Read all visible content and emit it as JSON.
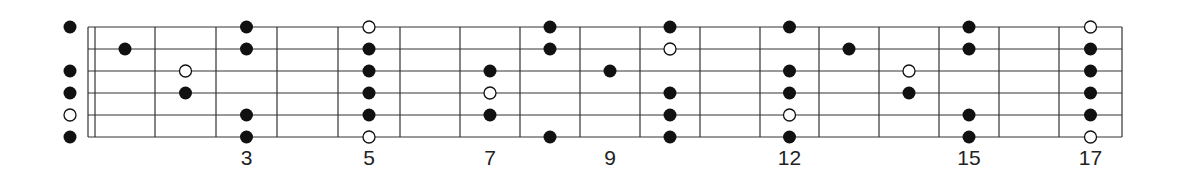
{
  "diagram": {
    "title": "",
    "type": "guitar-fretboard-scale-pattern",
    "strings": 6,
    "frets_shown": 17,
    "colors": {
      "line": "#333333",
      "dot_filled": "#111111",
      "dot_open_fill": "#ffffff"
    },
    "fret_labels": [
      {
        "fret": 3,
        "label": "3"
      },
      {
        "fret": 5,
        "label": "5"
      },
      {
        "fret": 7,
        "label": "7"
      },
      {
        "fret": 9,
        "label": "9"
      },
      {
        "fret": 12,
        "label": "12"
      },
      {
        "fret": 15,
        "label": "15"
      },
      {
        "fret": 17,
        "label": "17"
      }
    ],
    "dots": [
      {
        "fret": 0,
        "string": 0,
        "type": "filled"
      },
      {
        "fret": 0,
        "string": 2,
        "type": "filled"
      },
      {
        "fret": 0,
        "string": 3,
        "type": "filled"
      },
      {
        "fret": 0,
        "string": 4,
        "type": "open"
      },
      {
        "fret": 0,
        "string": 5,
        "type": "filled"
      },
      {
        "fret": 1,
        "string": 1,
        "type": "filled"
      },
      {
        "fret": 2,
        "string": 2,
        "type": "open"
      },
      {
        "fret": 2,
        "string": 3,
        "type": "filled"
      },
      {
        "fret": 3,
        "string": 0,
        "type": "filled"
      },
      {
        "fret": 3,
        "string": 1,
        "type": "filled"
      },
      {
        "fret": 3,
        "string": 4,
        "type": "filled"
      },
      {
        "fret": 3,
        "string": 5,
        "type": "filled"
      },
      {
        "fret": 5,
        "string": 0,
        "type": "open"
      },
      {
        "fret": 5,
        "string": 1,
        "type": "filled"
      },
      {
        "fret": 5,
        "string": 2,
        "type": "filled"
      },
      {
        "fret": 5,
        "string": 3,
        "type": "filled"
      },
      {
        "fret": 5,
        "string": 4,
        "type": "filled"
      },
      {
        "fret": 5,
        "string": 5,
        "type": "open"
      },
      {
        "fret": 7,
        "string": 2,
        "type": "filled"
      },
      {
        "fret": 7,
        "string": 3,
        "type": "open"
      },
      {
        "fret": 7,
        "string": 4,
        "type": "filled"
      },
      {
        "fret": 8,
        "string": 0,
        "type": "filled"
      },
      {
        "fret": 8,
        "string": 1,
        "type": "filled"
      },
      {
        "fret": 8,
        "string": 5,
        "type": "filled"
      },
      {
        "fret": 9,
        "string": 2,
        "type": "filled"
      },
      {
        "fret": 10,
        "string": 0,
        "type": "filled"
      },
      {
        "fret": 10,
        "string": 1,
        "type": "open"
      },
      {
        "fret": 10,
        "string": 3,
        "type": "filled"
      },
      {
        "fret": 10,
        "string": 4,
        "type": "filled"
      },
      {
        "fret": 10,
        "string": 5,
        "type": "filled"
      },
      {
        "fret": 12,
        "string": 0,
        "type": "filled"
      },
      {
        "fret": 12,
        "string": 2,
        "type": "filled"
      },
      {
        "fret": 12,
        "string": 3,
        "type": "filled"
      },
      {
        "fret": 12,
        "string": 4,
        "type": "open"
      },
      {
        "fret": 12,
        "string": 5,
        "type": "filled"
      },
      {
        "fret": 13,
        "string": 1,
        "type": "filled"
      },
      {
        "fret": 14,
        "string": 2,
        "type": "open"
      },
      {
        "fret": 14,
        "string": 3,
        "type": "filled"
      },
      {
        "fret": 15,
        "string": 0,
        "type": "filled"
      },
      {
        "fret": 15,
        "string": 1,
        "type": "filled"
      },
      {
        "fret": 15,
        "string": 4,
        "type": "filled"
      },
      {
        "fret": 15,
        "string": 5,
        "type": "filled"
      },
      {
        "fret": 17,
        "string": 0,
        "type": "open"
      },
      {
        "fret": 17,
        "string": 1,
        "type": "filled"
      },
      {
        "fret": 17,
        "string": 2,
        "type": "filled"
      },
      {
        "fret": 17,
        "string": 3,
        "type": "filled"
      },
      {
        "fret": 17,
        "string": 4,
        "type": "filled"
      },
      {
        "fret": 17,
        "string": 5,
        "type": "open"
      }
    ]
  }
}
